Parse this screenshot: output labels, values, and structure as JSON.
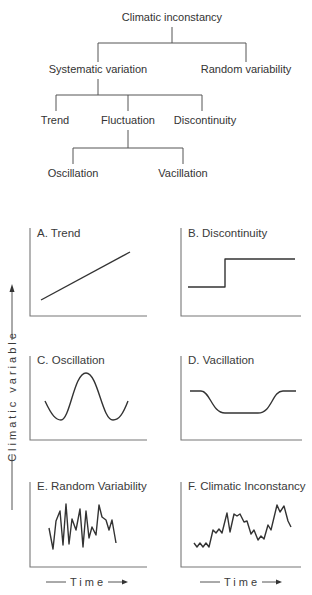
{
  "tree": {
    "root": "Climatic inconstancy",
    "level1": [
      "Systematic variation",
      "Random variability"
    ],
    "level2": [
      "Trend",
      "Fluctuation",
      "Discontinuity"
    ],
    "level3": [
      "Oscillation",
      "Vacillation"
    ]
  },
  "panels": [
    {
      "id": "A",
      "title": "A. Trend",
      "kind": "trend"
    },
    {
      "id": "B",
      "title": "B. Discontinuity",
      "kind": "step"
    },
    {
      "id": "C",
      "title": "C. Oscillation",
      "kind": "oscillation"
    },
    {
      "id": "D",
      "title": "D. Vacillation",
      "kind": "vacillation"
    },
    {
      "id": "E",
      "title": "E. Random Variability",
      "kind": "random"
    },
    {
      "id": "F",
      "title": "F. Climatic Inconstancy",
      "kind": "inconstancy"
    }
  ],
  "axes": {
    "y_label": "Climatic variable",
    "x_label": "Time"
  },
  "colors": {
    "line": "#333333",
    "axis": "#777777",
    "text": "#333333"
  }
}
